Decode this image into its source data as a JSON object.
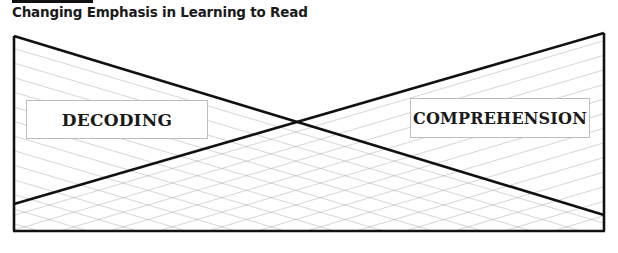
{
  "header": {
    "title": "Changing Emphasis in Learning to Read"
  },
  "diagram": {
    "labels": {
      "decoding": "DECODING",
      "comprehension": "COMPREHENSION"
    },
    "colors": {
      "outline": "#111111",
      "hatch": "#9a9a9a",
      "box_border": "#bdbdbd"
    }
  }
}
